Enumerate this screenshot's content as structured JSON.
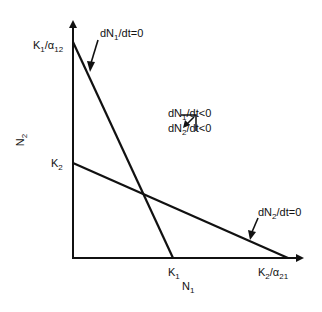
{
  "diagram": {
    "title": "",
    "axes": {
      "x_label": "N",
      "x_label_sub": "1",
      "y_label": "N",
      "y_label_sub": "2"
    },
    "intercepts": {
      "y_upper": {
        "main": "K",
        "sub1": "1",
        "slash": "/α",
        "sub2": "12"
      },
      "y_lower": {
        "main": "K",
        "sub1": "2"
      },
      "x_left": {
        "main": "K",
        "sub1": "1"
      },
      "x_right": {
        "main": "K",
        "sub1": "2",
        "slash": "/α",
        "sub2": "21"
      }
    },
    "isoclines": [
      {
        "name": "N1 isocline",
        "label_a": "dN",
        "label_sub": "1",
        "label_b": "/dt=0"
      },
      {
        "name": "N2 isocline",
        "label_a": "dN",
        "label_sub": "2",
        "label_b": "/dt=0"
      }
    ],
    "region_annotation": {
      "line1_a": "dN",
      "line1_sub": "1",
      "line1_b": "/dt<0",
      "line2_a": "dN",
      "line2_sub": "2",
      "line2_b": "/dt<0"
    },
    "colors": {
      "line": "#111111",
      "background": "#ffffff"
    }
  }
}
